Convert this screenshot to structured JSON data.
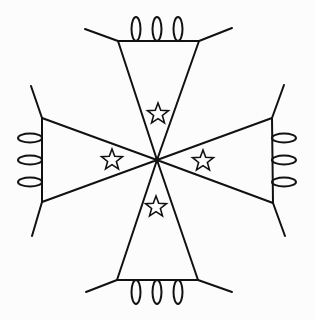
{
  "diagram": {
    "title": "",
    "canvas": {
      "width": 315,
      "height": 320
    },
    "colors": {
      "stroke": "#111111",
      "background": "#fcfcfc"
    },
    "center_vertex": {
      "x": 157,
      "y": 160
    },
    "arms": [
      {
        "id": "top",
        "outer_edge": [
          [
            118,
            41
          ],
          [
            199,
            41
          ]
        ],
        "legs": [
          [
            [
              118,
              41
            ],
            [
              85,
              29
            ]
          ],
          [
            [
              199,
              41
            ],
            [
              232,
              28
            ]
          ]
        ],
        "loops": [
          {
            "cx": 136,
            "cy": 29,
            "rx": 4.5,
            "ry": 12
          },
          {
            "cx": 157,
            "cy": 29,
            "rx": 4.5,
            "ry": 12
          },
          {
            "cx": 178,
            "cy": 29,
            "rx": 4.5,
            "ry": 12
          }
        ],
        "star": {
          "cx": 158,
          "cy": 114,
          "r": 11,
          "icon": "star-outline-icon"
        }
      },
      {
        "id": "left",
        "outer_edge": [
          [
            42,
            118
          ],
          [
            42,
            202
          ]
        ],
        "legs": [
          [
            [
              42,
              118
            ],
            [
              31,
              86
            ]
          ],
          [
            [
              42,
              202
            ],
            [
              32,
              236
            ]
          ]
        ],
        "loops": [
          {
            "cx": 30,
            "cy": 138,
            "rx": 12,
            "ry": 4.5
          },
          {
            "cx": 30,
            "cy": 160,
            "rx": 12,
            "ry": 4.5
          },
          {
            "cx": 30,
            "cy": 182,
            "rx": 12,
            "ry": 4.5
          }
        ],
        "star": {
          "cx": 112,
          "cy": 160,
          "r": 11,
          "icon": "star-outline-icon"
        }
      },
      {
        "id": "right",
        "outer_edge": [
          [
            272,
            118
          ],
          [
            273,
            203
          ]
        ],
        "legs": [
          [
            [
              272,
              118
            ],
            [
              284,
              85
            ]
          ],
          [
            [
              273,
              203
            ],
            [
              285,
              236
            ]
          ]
        ],
        "loops": [
          {
            "cx": 284,
            "cy": 138,
            "rx": 12,
            "ry": 4.5
          },
          {
            "cx": 284,
            "cy": 160,
            "rx": 12,
            "ry": 4.5
          },
          {
            "cx": 284,
            "cy": 182,
            "rx": 12,
            "ry": 4.5
          }
        ],
        "star": {
          "cx": 203,
          "cy": 161,
          "r": 11,
          "icon": "star-outline-icon"
        }
      },
      {
        "id": "bottom",
        "outer_edge": [
          [
            117,
            280
          ],
          [
            198,
            280
          ]
        ],
        "legs": [
          [
            [
              117,
              280
            ],
            [
              86,
              292
            ]
          ],
          [
            [
              198,
              280
            ],
            [
              232,
              292
            ]
          ]
        ],
        "loops": [
          {
            "cx": 136,
            "cy": 292,
            "rx": 4.5,
            "ry": 12
          },
          {
            "cx": 157,
            "cy": 292,
            "rx": 4.5,
            "ry": 12
          },
          {
            "cx": 178,
            "cy": 292,
            "rx": 4.5,
            "ry": 12
          }
        ],
        "star": {
          "cx": 156,
          "cy": 207,
          "r": 11,
          "icon": "star-outline-icon"
        }
      }
    ]
  }
}
